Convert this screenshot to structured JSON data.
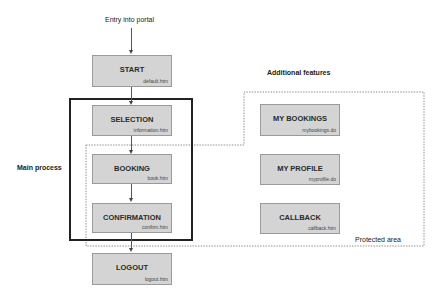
{
  "diagram": {
    "entry_label": "Entry into portal",
    "main_process_label": "Main process",
    "additional_features_label": "Additional features",
    "protected_area_label": "Protected area",
    "main_flow": [
      {
        "title": "START",
        "file": "default.htm"
      },
      {
        "title": "SELECTION",
        "file": "information.htm"
      },
      {
        "title": "BOOKING",
        "file": "book.htm"
      },
      {
        "title": "CONFIRMATION",
        "file": "confirm.htm"
      },
      {
        "title": "LOGOUT",
        "file": "logout.htm"
      }
    ],
    "features": [
      {
        "title": "MY BOOKINGS",
        "file": "mybookings.do"
      },
      {
        "title": "MY PROFILE",
        "file": "myprofile.do"
      },
      {
        "title": "CALLBACK",
        "file": "callback.htm"
      }
    ],
    "colors": {
      "box_fill": "#d4d4d4",
      "box_border": "#9a9a9a",
      "frame": "#222222",
      "dashed": "#777777"
    }
  }
}
